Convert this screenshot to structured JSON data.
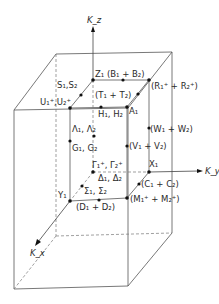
{
  "diagram": {
    "type": "brillouin-zone",
    "axes": {
      "z": "K_z",
      "y": "K_y",
      "x": "K_x"
    },
    "points": [
      {
        "id": "Z",
        "label": "Z₁ (B₁ + B₂)"
      },
      {
        "id": "R",
        "label": "(R₁⁺ + R₂⁺)"
      },
      {
        "id": "T",
        "label": "(T₁ + T₂)"
      },
      {
        "id": "S",
        "label": "S₁,S₂"
      },
      {
        "id": "U",
        "label": "U₁⁺,U₂⁺"
      },
      {
        "id": "H",
        "label": "H₁, H₂"
      },
      {
        "id": "A",
        "label": "A₁"
      },
      {
        "id": "W",
        "label": "(W₁ + W₂)"
      },
      {
        "id": "Lambda",
        "label": "Λ₁, Λ₂"
      },
      {
        "id": "G",
        "label": "G₁, G₂"
      },
      {
        "id": "V",
        "label": "(V₁ + V₂)"
      },
      {
        "id": "Gamma",
        "label": "Γ₁⁺, Γ₂⁺"
      },
      {
        "id": "X",
        "label": "X₁"
      },
      {
        "id": "Delta",
        "label": "Δ₁, Δ₂"
      },
      {
        "id": "C",
        "label": "(C₁ + C₂)"
      },
      {
        "id": "Sigma",
        "label": "Σ₁, Σ₂"
      },
      {
        "id": "Y",
        "label": "Y₁"
      },
      {
        "id": "M",
        "label": "(M₁⁺ + M₂⁺)"
      },
      {
        "id": "D",
        "label": "(D₁ + D₂)"
      }
    ]
  }
}
